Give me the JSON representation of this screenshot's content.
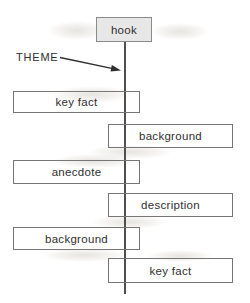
{
  "diagram": {
    "theme_label": "THEME",
    "hook_label": "hook",
    "boxes": [
      {
        "label": "key fact",
        "side": "left"
      },
      {
        "label": "background",
        "side": "right"
      },
      {
        "label": "anecdote",
        "side": "left"
      },
      {
        "label": "description",
        "side": "right"
      },
      {
        "label": "background",
        "side": "left"
      },
      {
        "label": "key fact",
        "side": "right"
      }
    ],
    "colors": {
      "hook_fill": "#e7e7e7",
      "box_border": "#767676",
      "spine_line": "#4f4f4f",
      "text": "#2f2f2f",
      "page_background": "#ffffff"
    }
  }
}
